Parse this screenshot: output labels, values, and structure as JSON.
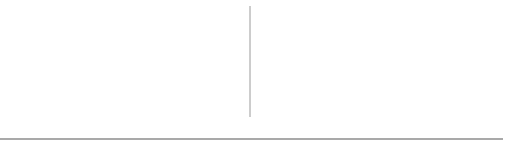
{
  "graph": {
    "nodes": [
      {
        "id": "1",
        "x": 40,
        "y": 23
      },
      {
        "id": "2",
        "x": 119,
        "y": 23
      },
      {
        "id": "3",
        "x": 171,
        "y": 67
      },
      {
        "id": "4",
        "x": 118,
        "y": 103
      },
      {
        "id": "5",
        "x": 40,
        "y": 103
      }
    ],
    "edges": [
      [
        "1",
        "2"
      ],
      [
        "1",
        "5"
      ],
      [
        "2",
        "5"
      ],
      [
        "2",
        "4"
      ],
      [
        "2",
        "3"
      ],
      [
        "3",
        "4"
      ],
      [
        "4",
        "5"
      ]
    ],
    "node_radius": 11
  },
  "adjacency_list": {
    "head_cells": [
      "1",
      "2",
      "3",
      "4",
      "5"
    ],
    "rows": [
      {
        "vertex": "1",
        "neighbors": [
          "2",
          "5"
        ]
      },
      {
        "vertex": "2",
        "neighbors": [
          "1",
          "3",
          "4",
          "5"
        ]
      },
      {
        "vertex": "3",
        "neighbors": [
          "2",
          "4"
        ]
      },
      {
        "vertex": "4",
        "neighbors": [
          "2",
          "3",
          "5"
        ]
      },
      {
        "vertex": "5",
        "neighbors": [
          "1",
          "2",
          "4"
        ]
      }
    ],
    "terminator": "null-ground-symbol"
  },
  "colors": {
    "line": "#1a1a1a",
    "divider": "#9a9a9a",
    "background": "#ffffff"
  }
}
